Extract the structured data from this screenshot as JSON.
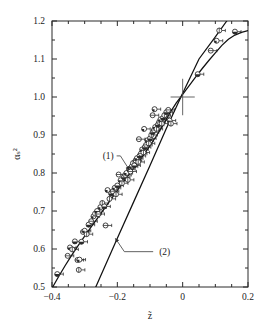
{
  "figure": {
    "caption_labels": {
      "curve1": "(1)",
      "curve2": "(2)"
    }
  },
  "chart_data": {
    "type": "scatter",
    "title": "",
    "subtitle": "",
    "xlabel": "z̃",
    "ylabel": "αₛ²",
    "xlim": [
      -0.4,
      0.2
    ],
    "ylim": [
      0.5,
      1.2
    ],
    "xticks": [
      -0.4,
      -0.2,
      0,
      0.2
    ],
    "xticklabels": [
      "−0.4",
      "−0.2",
      "0",
      "0.2"
    ],
    "yticks": [
      0.5,
      0.6,
      0.7,
      0.8,
      0.9,
      1.0,
      1.1,
      1.2
    ],
    "yticklabels": [
      "0.5",
      "0.6",
      "0.7",
      "0.8",
      "0.9",
      "1.0",
      "1.1",
      "1.2"
    ],
    "grid": false,
    "legend_position": "none",
    "minor_xticks": [
      -0.35,
      -0.3,
      -0.25,
      -0.15,
      -0.1,
      -0.05,
      0.05,
      0.1,
      0.15
    ],
    "marker_style": "open-circle-with-horizontal-errorbar",
    "annotations": [
      {
        "text": "(1)",
        "text_x": -0.245,
        "text_y": 0.845,
        "point_x": -0.163,
        "point_y": 0.808,
        "name": "curve-1-callout"
      },
      {
        "text": "(2)",
        "text_x": -0.078,
        "text_y": 0.593,
        "point_x": -0.206,
        "point_y": 0.628,
        "name": "curve-2-callout"
      }
    ],
    "reference_marker": {
      "name": "origin-cross",
      "x": 0.0,
      "y": 1.0,
      "x_halfwidth": 0.037,
      "y_halfheight": 0.048
    },
    "series": [
      {
        "name": "curve-1-theory",
        "kind": "line",
        "label": "(1)",
        "points": [
          [
            -0.4,
            0.497
          ],
          [
            -0.38,
            0.527
          ],
          [
            -0.36,
            0.556
          ],
          [
            -0.34,
            0.583
          ],
          [
            -0.32,
            0.609
          ],
          [
            -0.3,
            0.634
          ],
          [
            -0.28,
            0.658
          ],
          [
            -0.26,
            0.682
          ],
          [
            -0.24,
            0.706
          ],
          [
            -0.22,
            0.73
          ],
          [
            -0.2,
            0.754
          ],
          [
            -0.18,
            0.778
          ],
          [
            -0.16,
            0.801
          ],
          [
            -0.14,
            0.824
          ],
          [
            -0.12,
            0.847
          ],
          [
            -0.1,
            0.872
          ],
          [
            -0.08,
            0.898
          ],
          [
            -0.06,
            0.926
          ],
          [
            -0.04,
            0.957
          ],
          [
            -0.02,
            0.984
          ],
          [
            0.0,
            1.007
          ],
          [
            0.02,
            1.03
          ],
          [
            0.04,
            1.053
          ],
          [
            0.06,
            1.075
          ],
          [
            0.08,
            1.096
          ],
          [
            0.1,
            1.116
          ],
          [
            0.12,
            1.136
          ],
          [
            0.14,
            1.152
          ],
          [
            0.16,
            1.163
          ],
          [
            0.18,
            1.17
          ],
          [
            0.2,
            1.175
          ]
        ]
      },
      {
        "name": "curve-2-theory",
        "kind": "line",
        "label": "(2)",
        "points": [
          [
            -0.266,
            0.5
          ],
          [
            -0.2,
            0.628
          ],
          [
            -0.15,
            0.724
          ],
          [
            -0.1,
            0.82
          ],
          [
            -0.05,
            0.917
          ],
          [
            0.0,
            1.01
          ],
          [
            0.05,
            1.1
          ],
          [
            0.1,
            1.158
          ],
          [
            0.135,
            1.2
          ]
        ]
      },
      {
        "name": "experimental-data",
        "kind": "scatter",
        "label": "",
        "points": [
          [
            -0.384,
            0.534
          ],
          [
            -0.352,
            0.582
          ],
          [
            -0.345,
            0.604
          ],
          [
            -0.338,
            0.599
          ],
          [
            -0.33,
            0.62
          ],
          [
            -0.322,
            0.571
          ],
          [
            -0.316,
            0.572
          ],
          [
            -0.318,
            0.545
          ],
          [
            -0.31,
            0.619
          ],
          [
            -0.305,
            0.645
          ],
          [
            -0.3,
            0.648
          ],
          [
            -0.294,
            0.639
          ],
          [
            -0.288,
            0.664
          ],
          [
            -0.28,
            0.673
          ],
          [
            -0.273,
            0.686
          ],
          [
            -0.268,
            0.693
          ],
          [
            -0.262,
            0.7
          ],
          [
            -0.258,
            0.692
          ],
          [
            -0.252,
            0.71
          ],
          [
            -0.246,
            0.721
          ],
          [
            -0.24,
            0.712
          ],
          [
            -0.236,
            0.662
          ],
          [
            -0.23,
            0.755
          ],
          [
            -0.224,
            0.732
          ],
          [
            -0.219,
            0.746
          ],
          [
            -0.214,
            0.752
          ],
          [
            -0.208,
            0.761
          ],
          [
            -0.204,
            0.744
          ],
          [
            -0.2,
            0.767
          ],
          [
            -0.196,
            0.796
          ],
          [
            -0.19,
            0.781
          ],
          [
            -0.186,
            0.773
          ],
          [
            -0.18,
            0.789
          ],
          [
            -0.176,
            0.795
          ],
          [
            -0.172,
            0.8
          ],
          [
            -0.168,
            0.782
          ],
          [
            -0.164,
            0.81
          ],
          [
            -0.16,
            0.804
          ],
          [
            -0.156,
            0.817
          ],
          [
            -0.152,
            0.826
          ],
          [
            -0.148,
            0.82
          ],
          [
            -0.144,
            0.833
          ],
          [
            -0.14,
            0.839
          ],
          [
            -0.136,
            0.829
          ],
          [
            -0.132,
            0.845
          ],
          [
            -0.128,
            0.851
          ],
          [
            -0.124,
            0.862
          ],
          [
            -0.12,
            0.854
          ],
          [
            -0.116,
            0.868
          ],
          [
            -0.112,
            0.874
          ],
          [
            -0.108,
            0.886
          ],
          [
            -0.104,
            0.878
          ],
          [
            -0.1,
            0.891
          ],
          [
            -0.134,
            0.889
          ],
          [
            -0.118,
            0.916
          ],
          [
            -0.096,
            0.9
          ],
          [
            -0.092,
            0.907
          ],
          [
            -0.088,
            0.913
          ],
          [
            -0.084,
            0.921
          ],
          [
            -0.08,
            0.916
          ],
          [
            -0.076,
            0.927
          ],
          [
            -0.072,
            0.934
          ],
          [
            -0.068,
            0.941
          ],
          [
            -0.064,
            0.93
          ],
          [
            -0.06,
            0.945
          ],
          [
            -0.092,
            0.952
          ],
          [
            -0.086,
            0.968
          ],
          [
            -0.056,
            0.952
          ],
          [
            -0.05,
            0.96
          ],
          [
            -0.044,
            0.966
          ],
          [
            -0.04,
            0.938
          ],
          [
            -0.036,
            0.93
          ],
          [
            0.046,
            1.06
          ],
          [
            0.086,
            1.122
          ],
          [
            0.104,
            1.148
          ],
          [
            0.112,
            1.175
          ],
          [
            0.16,
            1.172
          ]
        ]
      }
    ]
  }
}
